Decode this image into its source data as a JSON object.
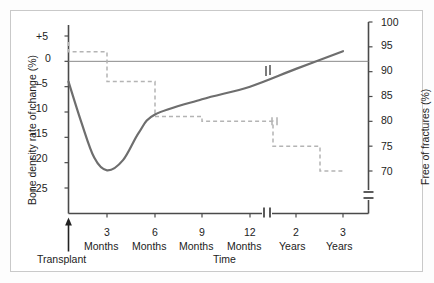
{
  "figure": {
    "background": "#ffffff",
    "border_color": "#c9c9c9",
    "series_color": "#6e6e6e",
    "dashed_color": "#b4b4b4",
    "axis_color": "#4a4a4a",
    "transplant_label": "Transplant",
    "x_axis_title": "Time",
    "left_axis_title": "Bone density rate of change (%)",
    "right_axis_title": "Free of fractures (%)"
  },
  "chart_data": {
    "type": "line",
    "title": "",
    "xlabel": "Time",
    "annotations": [
      "Transplant"
    ],
    "grid": false,
    "legend": null,
    "x_categories": [
      "3\nMonths",
      "6\nMonths",
      "9\nMonths",
      "12\nMonths",
      "2\nYears",
      "3\nYears"
    ],
    "x_tick_labels_top": [
      "3",
      "6",
      "9",
      "12",
      "2",
      "3"
    ],
    "x_tick_labels_bottom": [
      "Months",
      "Months",
      "Months",
      "Months",
      "Years",
      "Years"
    ],
    "axis_break_on_x": true,
    "left_axis": {
      "label": "Bone density rate of change (%)",
      "tick_labels": [
        "+5",
        "0",
        "–5",
        "–10",
        "–15",
        "–20",
        "–25"
      ],
      "ticks": [
        5,
        0,
        -5,
        -10,
        -15,
        -20,
        -25
      ],
      "ylim": [
        -27.5,
        7
      ]
    },
    "right_axis": {
      "label": "Free of fractures (%)",
      "tick_labels": [
        "100",
        "95",
        "90",
        "85",
        "80",
        "75",
        "70"
      ],
      "ticks": [
        100,
        95,
        90,
        85,
        80,
        75,
        70
      ],
      "ylim": [
        68,
        101
      ],
      "axis_break": true
    },
    "series": [
      {
        "name": "Bone density rate of change",
        "axis": "left",
        "style": "solid",
        "color": "#6e6e6e",
        "has_break_marker": true,
        "points": [
          {
            "x_months": 0,
            "y": -4.0
          },
          {
            "x_months": 1,
            "y": -12.0
          },
          {
            "x_months": 2,
            "y": -19.0
          },
          {
            "x_months": 3,
            "y": -21.5
          },
          {
            "x_months": 4,
            "y": -19.5
          },
          {
            "x_months": 5,
            "y": -14.0
          },
          {
            "x_months": 6,
            "y": -10.5
          },
          {
            "x_months": 9,
            "y": -7.5
          },
          {
            "x_months": 12,
            "y": -5.0
          },
          {
            "x_months": 24,
            "y": -1.5
          },
          {
            "x_months": 36,
            "y": 2.0
          }
        ]
      },
      {
        "name": "Free of fractures",
        "axis": "right",
        "style": "dashed-step",
        "color": "#b4b4b4",
        "steps": [
          {
            "x_months": 0,
            "y": 96
          },
          {
            "x_months": 0,
            "y": 94
          },
          {
            "x_months": 3,
            "y": 94
          },
          {
            "x_months": 3,
            "y": 88
          },
          {
            "x_months": 6,
            "y": 88
          },
          {
            "x_months": 6,
            "y": 81
          },
          {
            "x_months": 9,
            "y": 81
          },
          {
            "x_months": 9,
            "y": 80
          },
          {
            "x_months": 18,
            "y": 80
          },
          {
            "x_months": 18,
            "y": 75
          },
          {
            "x_months": 30,
            "y": 75
          },
          {
            "x_months": 30,
            "y": 70
          },
          {
            "x_months": 36,
            "y": 70
          }
        ]
      }
    ]
  }
}
